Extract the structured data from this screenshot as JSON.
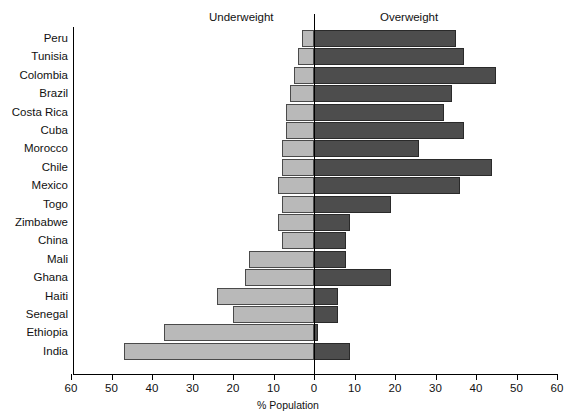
{
  "header": {
    "underweight_label": "Underweight",
    "overweight_label": "Overweight"
  },
  "axis": {
    "x_title": "% Population",
    "tick_labels": [
      "60",
      "50",
      "40",
      "30",
      "20",
      "10",
      "0",
      "10",
      "20",
      "30",
      "40",
      "50",
      "60"
    ]
  },
  "colors": {
    "underweight_fill": "#b9b9b9",
    "overweight_fill": "#4d4d4d",
    "axis": "#000000",
    "background": "#ffffff"
  },
  "chart_data": {
    "type": "bar",
    "orientation": "horizontal",
    "subtype": "diverging-population-pyramid",
    "title": "",
    "xlabel": "% Population",
    "ylabel": "",
    "xlim": [
      -60,
      60
    ],
    "x_ticks": [
      -60,
      -50,
      -40,
      -30,
      -20,
      -10,
      0,
      10,
      20,
      30,
      40,
      50,
      60
    ],
    "x_tick_labels": [
      "60",
      "50",
      "40",
      "30",
      "20",
      "10",
      "0",
      "10",
      "20",
      "30",
      "40",
      "50",
      "60"
    ],
    "grid": false,
    "legend": "none",
    "panel_titles": [
      "Underweight",
      "Overweight"
    ],
    "categories": [
      "Peru",
      "Tunisia",
      "Colombia",
      "Brazil",
      "Costa Rica",
      "Cuba",
      "Morocco",
      "Chile",
      "Mexico",
      "Togo",
      "Zimbabwe",
      "China",
      "Mali",
      "Ghana",
      "Haiti",
      "Senegal",
      "Ethiopia",
      "India"
    ],
    "series": [
      {
        "name": "Underweight",
        "direction": "left",
        "color": "#b9b9b9",
        "values": [
          3,
          4,
          5,
          6,
          7,
          7,
          8,
          8,
          9,
          8,
          9,
          8,
          16,
          17,
          24,
          20,
          37,
          47
        ]
      },
      {
        "name": "Overweight",
        "direction": "right",
        "color": "#4d4d4d",
        "values": [
          35,
          37,
          45,
          34,
          32,
          37,
          26,
          44,
          36,
          19,
          9,
          8,
          8,
          19,
          6,
          6,
          1,
          9
        ]
      }
    ]
  }
}
